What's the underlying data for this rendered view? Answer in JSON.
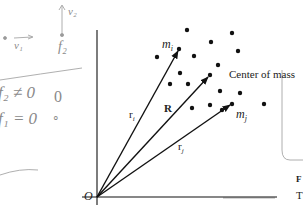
{
  "diagram": {
    "labels": {
      "origin": "O",
      "mass_i": "m",
      "mass_i_sub": "i",
      "mass_j": "m",
      "mass_j_sub": "j",
      "vector_ri": "r",
      "vector_ri_sub": "i",
      "vector_rj": "r",
      "vector_rj_sub": "j",
      "vector_R": "R",
      "center_of_mass": "Center of mass"
    },
    "vectors": [
      {
        "name": "r_i",
        "from": [
          97,
          197
        ],
        "to": [
          179,
          49
        ]
      },
      {
        "name": "R",
        "from": [
          97,
          197
        ],
        "to": [
          210,
          75
        ]
      },
      {
        "name": "r_j",
        "from": [
          97,
          197
        ],
        "to": [
          232,
          104
        ]
      }
    ],
    "particles": [
      [
        187,
        30
      ],
      [
        232,
        35
      ],
      [
        211,
        46
      ],
      [
        238,
        52
      ],
      [
        179,
        49
      ],
      [
        194,
        56
      ],
      [
        157,
        56
      ],
      [
        218,
        66
      ],
      [
        180,
        73
      ],
      [
        170,
        84
      ],
      [
        188,
        84
      ],
      [
        210,
        75
      ],
      [
        240,
        86
      ],
      [
        213,
        95
      ],
      [
        206,
        104
      ],
      [
        221,
        90
      ],
      [
        232,
        104
      ],
      [
        264,
        104
      ]
    ],
    "colors": {
      "ink": "#111111",
      "pencil": "#8a8a8a"
    }
  },
  "handwritten_notes": {
    "v2": "v₂",
    "v1": "v₁",
    "f2_top": "f₂",
    "f2_ne": "f₂ ≠ 0",
    "f1_eq": "f₁ = 0",
    "zero_mark": "0",
    "dot_mark": "∘"
  },
  "margin_text": {
    "fig_prefix": "F",
    "t_prefix": "T"
  }
}
